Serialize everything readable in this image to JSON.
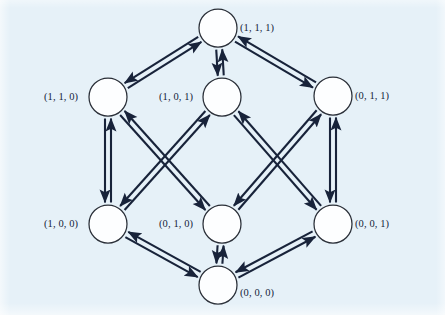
{
  "figure": {
    "kind": "state-transition-diagram",
    "background_color": "#e6f1f8",
    "stroke_color": "#18233a",
    "node_fill_color": "#fdfeff",
    "node_stroke_color": "#2a2f38",
    "node_radius": 19,
    "label_color": "#14243a"
  },
  "nodes": [
    {
      "id": "n111",
      "label": "(1, 1, 1)",
      "cx": 218,
      "cy": 28,
      "label_x": 240,
      "label_y": 23,
      "label_side": "right"
    },
    {
      "id": "n110",
      "label": "(1, 1, 0)",
      "cx": 108,
      "cy": 97,
      "label_x": 44,
      "label_y": 92,
      "label_side": "left"
    },
    {
      "id": "n101",
      "label": "(1, 0, 1)",
      "cx": 222,
      "cy": 97,
      "label_x": 159,
      "label_y": 92,
      "label_side": "left"
    },
    {
      "id": "n011",
      "label": "(0, 1, 1)",
      "cx": 333,
      "cy": 96,
      "label_x": 355,
      "label_y": 91,
      "label_side": "right"
    },
    {
      "id": "n100",
      "label": "(1, 0, 0)",
      "cx": 108,
      "cy": 224,
      "label_x": 44,
      "label_y": 219,
      "label_side": "left"
    },
    {
      "id": "n010",
      "label": "(0, 1, 0)",
      "cx": 222,
      "cy": 224,
      "label_x": 159,
      "label_y": 219,
      "label_side": "left"
    },
    {
      "id": "n001",
      "label": "(0, 0, 1)",
      "cx": 333,
      "cy": 224,
      "label_x": 355,
      "label_y": 219,
      "label_side": "right"
    },
    {
      "id": "n000",
      "label": "(0, 0, 0)",
      "cx": 218,
      "cy": 285,
      "label_x": 240,
      "label_y": 288,
      "label_side": "right"
    }
  ],
  "edges": [
    {
      "from": "n110",
      "to": "n111",
      "bidirectional": true
    },
    {
      "from": "n101",
      "to": "n111",
      "bidirectional": true
    },
    {
      "from": "n011",
      "to": "n111",
      "bidirectional": true
    },
    {
      "from": "n100",
      "to": "n110",
      "bidirectional": true
    },
    {
      "from": "n010",
      "to": "n110",
      "bidirectional": true
    },
    {
      "from": "n100",
      "to": "n101",
      "bidirectional": true
    },
    {
      "from": "n001",
      "to": "n101",
      "bidirectional": true
    },
    {
      "from": "n010",
      "to": "n011",
      "bidirectional": true
    },
    {
      "from": "n001",
      "to": "n011",
      "bidirectional": true
    },
    {
      "from": "n000",
      "to": "n100",
      "bidirectional": true
    },
    {
      "from": "n000",
      "to": "n010",
      "bidirectional": true
    },
    {
      "from": "n000",
      "to": "n001",
      "bidirectional": true
    }
  ],
  "chart_data": {
    "type": "diagram",
    "title": "",
    "node_count": 8,
    "edge_count": 12,
    "node_labels": [
      "(1, 1, 1)",
      "(1, 1, 0)",
      "(1, 0, 1)",
      "(0, 1, 1)",
      "(1, 0, 0)",
      "(0, 1, 0)",
      "(0, 0, 1)",
      "(0, 0, 0)"
    ]
  }
}
